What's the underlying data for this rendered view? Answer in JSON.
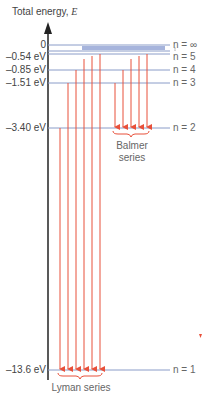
{
  "axis": {
    "title": "Total energy, ",
    "symbol": "E"
  },
  "levels": [
    {
      "n": "n = ∞",
      "energy": "0",
      "y": 45
    },
    {
      "n": "",
      "energy": "",
      "y": 48
    },
    {
      "n": "",
      "energy": "",
      "y": 50
    },
    {
      "n": "n = 5",
      "energy": "–0.54 eV",
      "y": 53
    },
    {
      "n": "n = 4",
      "energy": "–0.85 eV",
      "y": 70
    },
    {
      "n": "n = 3",
      "energy": "–1.51 eV",
      "y": 83
    },
    {
      "n": "n = 2",
      "energy": "–3.40 eV",
      "y": 128
    },
    {
      "n": "n = 1",
      "energy": "–13.6 eV",
      "y": 370
    }
  ],
  "labels": {
    "e0": "0",
    "e5": "–0.54 eV",
    "e4": "–0.85 eV",
    "e3": "–1.51 eV",
    "e2": "–3.40 eV",
    "e1": "–13.6 eV",
    "ninf": "n = ∞",
    "n5": "n = 5",
    "n4": "n = 4",
    "n3": "n = 3",
    "n2": "n = 2",
    "n1": "n = 1",
    "balmer_1": "Balmer",
    "balmer_2": "series",
    "lyman": "Lyman series"
  },
  "colors": {
    "level": "#8a9cc8",
    "arrow": "#e8503a",
    "axis": "#222222"
  }
}
